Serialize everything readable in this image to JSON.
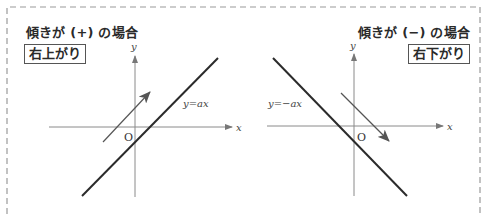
{
  "panels": {
    "left": {
      "title": "傾きが (+) の場合",
      "badge": "右上がり",
      "line_label": "y=ax",
      "origin_label": "O",
      "x_axis_label": "x",
      "y_axis_label": "y",
      "slope_sign": "+",
      "direction": "up-right"
    },
    "right": {
      "title": "傾きが (−) の場合",
      "badge": "右下がり",
      "line_label": "y=−ax",
      "origin_label": "O",
      "x_axis_label": "x",
      "y_axis_label": "y",
      "slope_sign": "−",
      "direction": "down-right"
    }
  },
  "colors": {
    "axis": "#888888",
    "line": "#2b2b2b",
    "arrow": "#555555",
    "border": "#999999"
  }
}
